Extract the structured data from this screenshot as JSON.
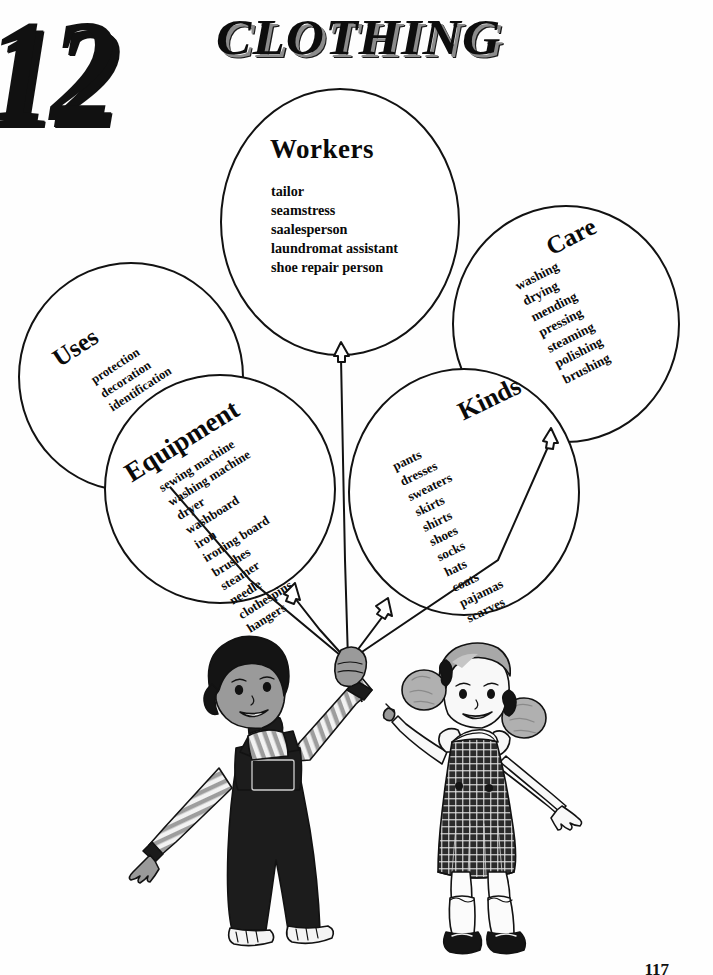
{
  "header": {
    "chapter_number": "12",
    "chapter_title": "CLOTHING"
  },
  "page_number": "117",
  "balloons": [
    {
      "id": "workers",
      "title": "Workers",
      "items": [
        "tailor",
        "seamstress",
        "saalesperson",
        "laundromat assistant",
        "shoe repair person"
      ]
    },
    {
      "id": "care",
      "title": "Care",
      "items": [
        "washing",
        "drying",
        "mending",
        "pressing",
        "steaming",
        "polishing",
        "brushing"
      ]
    },
    {
      "id": "uses",
      "title": "Uses",
      "items": [
        "protection",
        "decoration",
        "identification"
      ]
    },
    {
      "id": "equipment",
      "title": "Equipment",
      "items": [
        "sewing machine",
        "washing machine",
        "dryer",
        "washboard",
        "iron",
        "ironing board",
        "brushes",
        "steamer",
        "needle",
        "clothespins",
        "hangers"
      ]
    },
    {
      "id": "kinds",
      "title": "Kinds",
      "items": [
        "pants",
        "dresses",
        "sweaters",
        "skirts",
        "shirts",
        "shoes",
        "socks",
        "hats",
        "coats",
        "pajamas",
        "scarves"
      ]
    }
  ],
  "illustration": {
    "description": "two children holding balloon strings",
    "boy": "boy-with-overalls",
    "girl": "girl-with-gingham-jumper"
  },
  "colors": {
    "ink": "#111111",
    "paper": "#ffffff",
    "skin_gray": "#9a9a9a",
    "hair_dark": "#1a1a1a",
    "fabric_dark": "#1c1c1c",
    "fabric_gray": "#8e8e8e"
  }
}
